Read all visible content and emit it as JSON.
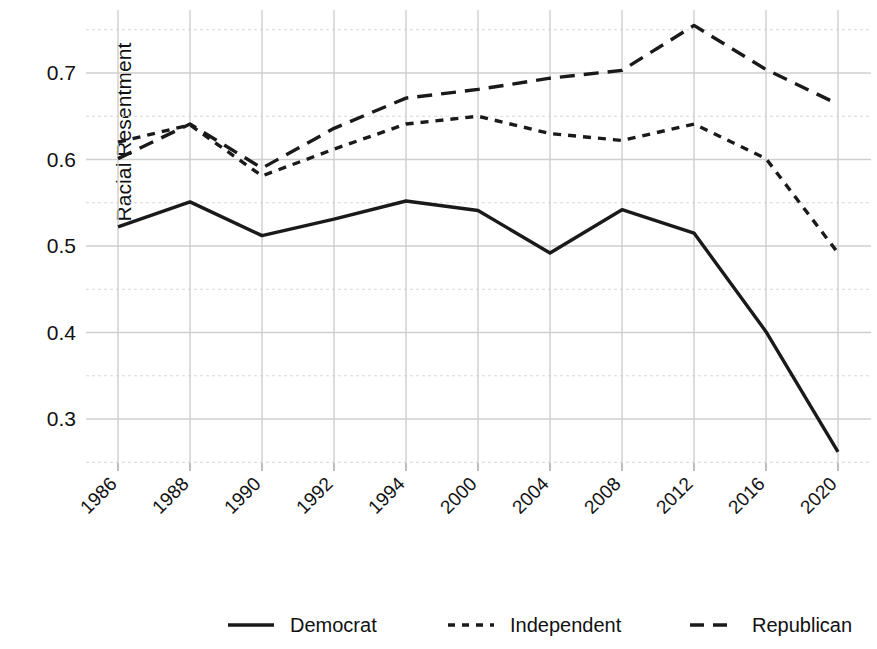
{
  "chart_data": {
    "type": "line",
    "title": "",
    "xlabel": "",
    "ylabel": "Racial Resentment",
    "categories": [
      "1986",
      "1988",
      "1990",
      "1992",
      "1994",
      "2000",
      "2004",
      "2008",
      "2012",
      "2016",
      "2020"
    ],
    "ylim": [
      0.24,
      0.775
    ],
    "yticks": [
      0.3,
      0.4,
      0.5,
      0.6,
      0.7
    ],
    "ytick_labels": [
      "0.3",
      "0.4",
      "0.5",
      "0.6",
      "0.7"
    ],
    "yminor_ticks": [
      0.25,
      0.35,
      0.45,
      0.55,
      0.65,
      0.75
    ],
    "grid": true,
    "legend_position": "bottom",
    "series": [
      {
        "name": "Democrat",
        "style": "solid",
        "color": "#1a1a1a",
        "values": [
          0.522,
          0.551,
          0.512,
          0.531,
          0.552,
          0.541,
          0.492,
          0.542,
          0.515,
          0.401,
          0.262
        ]
      },
      {
        "name": "Independent",
        "style": "dotted",
        "color": "#1a1a1a",
        "values": [
          0.62,
          0.64,
          0.581,
          0.612,
          0.641,
          0.65,
          0.63,
          0.622,
          0.641,
          0.601,
          0.492
        ]
      },
      {
        "name": "Republican",
        "style": "dashed",
        "color": "#1a1a1a",
        "values": [
          0.601,
          0.641,
          0.59,
          0.636,
          0.671,
          0.681,
          0.694,
          0.703,
          0.755,
          0.704,
          0.664
        ]
      }
    ]
  },
  "axis": {
    "y_title": "Racial Resentment"
  },
  "legend": {
    "items": [
      {
        "label": "Democrat",
        "style": "solid"
      },
      {
        "label": "Independent",
        "style": "dotted"
      },
      {
        "label": "Republican",
        "style": "dashed"
      }
    ]
  }
}
